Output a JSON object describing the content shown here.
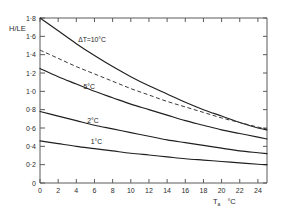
{
  "chart_data": {
    "type": "line",
    "title": "",
    "xlabel": "Tₐ  °C",
    "ylabel": "H/LE",
    "xlim": [
      0,
      25
    ],
    "ylim": [
      0,
      1.8
    ],
    "grid": false,
    "legend": "inline-curve-labels",
    "x_ticks": [
      0,
      2,
      4,
      6,
      8,
      10,
      12,
      14,
      16,
      18,
      20,
      22,
      24
    ],
    "x_tick_labels": [
      "0",
      "2",
      "4",
      "6",
      "8",
      "10",
      "12",
      "14",
      "16",
      "18",
      "20",
      "22",
      "24"
    ],
    "y_ticks": [
      0,
      0.2,
      0.4,
      0.6,
      0.8,
      1.0,
      1.2,
      1.4,
      1.6,
      1.8
    ],
    "y_tick_labels": [
      "0",
      "0·2",
      "0·4",
      "0·6",
      "0·8",
      "1·0",
      "1·2",
      "1·4",
      "1·6",
      "1·8"
    ],
    "x": [
      0,
      2,
      4,
      6,
      8,
      10,
      12,
      14,
      16,
      18,
      20,
      22,
      24,
      25
    ],
    "series": [
      {
        "name": "ΔT=10°C",
        "label": "ΔT=10°C",
        "style": "solid",
        "color": "#1f1f1f",
        "values": [
          1.8,
          1.66,
          1.52,
          1.39,
          1.27,
          1.16,
          1.06,
          0.97,
          0.88,
          0.8,
          0.73,
          0.66,
          0.6,
          0.58
        ]
      },
      {
        "name": "dashed-reference",
        "label": "",
        "style": "dashed",
        "color": "#3a3a3a",
        "values": [
          1.45,
          1.36,
          1.27,
          1.19,
          1.11,
          1.03,
          0.96,
          0.89,
          0.83,
          0.77,
          0.71,
          0.66,
          0.61,
          0.59
        ]
      },
      {
        "name": "5°C",
        "label": "5°C",
        "style": "solid",
        "color": "#1f1f1f",
        "values": [
          1.25,
          1.16,
          1.08,
          1.0,
          0.93,
          0.86,
          0.8,
          0.74,
          0.68,
          0.63,
          0.58,
          0.54,
          0.5,
          0.48
        ]
      },
      {
        "name": "2°C",
        "label": "2°C",
        "style": "solid",
        "color": "#1f1f1f",
        "values": [
          0.78,
          0.73,
          0.68,
          0.63,
          0.59,
          0.55,
          0.51,
          0.47,
          0.44,
          0.41,
          0.38,
          0.35,
          0.33,
          0.32
        ]
      },
      {
        "name": "1°C",
        "label": "1°C",
        "style": "solid",
        "color": "#1f1f1f",
        "values": [
          0.46,
          0.43,
          0.4,
          0.375,
          0.35,
          0.325,
          0.305,
          0.285,
          0.265,
          0.25,
          0.235,
          0.22,
          0.205,
          0.2
        ]
      }
    ],
    "annotations": [
      {
        "text": "ΔT=10°C",
        "x": 4.2,
        "y": 1.52
      },
      {
        "text": "5°C",
        "x": 4.8,
        "y": 1.0
      },
      {
        "text": "2°C",
        "x": 5.2,
        "y": 0.63
      },
      {
        "text": "1°C",
        "x": 5.6,
        "y": 0.4
      }
    ]
  },
  "axes": {
    "y_title": "H/LE",
    "x_title_main": "T",
    "x_title_sub": "a",
    "x_title_unit": "°C"
  },
  "colors": {
    "axis": "#5a5a5a",
    "curve": "#1f1f1f",
    "dashed": "#3a3a3a",
    "text": "#2b2b2b",
    "background": "#ffffff"
  }
}
